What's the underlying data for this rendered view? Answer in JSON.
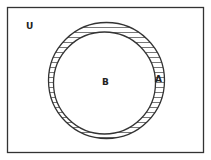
{
  "diagram": {
    "type": "venn",
    "universe_label": "U",
    "sets": [
      {
        "label": "A",
        "role": "outer circle",
        "contains": "B"
      },
      {
        "label": "B",
        "role": "inner circle"
      }
    ],
    "shaded_region": "A minus B",
    "colors": {
      "stroke": "#333333",
      "background": "#ffffff"
    }
  }
}
